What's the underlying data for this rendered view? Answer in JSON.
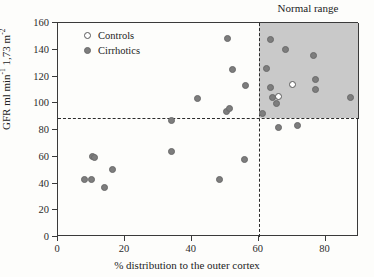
{
  "chart_data": {
    "type": "scatter",
    "title": "",
    "xlabel": "% distribution to the outer cortex",
    "ylabel": "GFR ml min⁻¹ 1,73 m⁻²",
    "ylabel_parts": {
      "main1": "GFR ml min",
      "sup1": "-1",
      "main2": " 1,73 m",
      "sup2": "-2"
    },
    "xlim": [
      0,
      90
    ],
    "ylim": [
      0,
      160
    ],
    "xticks": [
      0,
      20,
      40,
      60,
      80
    ],
    "yticks": [
      0,
      20,
      40,
      60,
      80,
      100,
      120,
      140,
      160
    ],
    "xtick_labels": [
      "0",
      "20",
      "40",
      "60",
      "80"
    ],
    "ytick_labels": [
      "0",
      "20",
      "40",
      "60",
      "80",
      "100",
      "120",
      "140",
      "160"
    ],
    "grid": false,
    "legend_position": "upper-left-inside",
    "annotations": [
      {
        "name": "normal-range-label",
        "text": "Normal range",
        "x": 75,
        "y": 166
      }
    ],
    "reference_lines": [
      {
        "name": "vertical-threshold",
        "orientation": "vertical",
        "value": 60,
        "style": "dashed"
      },
      {
        "name": "horizontal-threshold",
        "orientation": "horizontal",
        "value": 89,
        "style": "dashed"
      }
    ],
    "shaded_regions": [
      {
        "name": "normal-range-box",
        "x_range": [
          60,
          90
        ],
        "y_range": [
          89,
          160
        ],
        "color": "#c9c9c9",
        "label": "Normal range"
      }
    ],
    "series": [
      {
        "name": "Controls",
        "marker": "open-circle",
        "color": "#ffffff",
        "edge_color": "#595959",
        "points": [
          {
            "x": 66.0,
            "y": 105.0
          },
          {
            "x": 70.0,
            "y": 114.0
          }
        ]
      },
      {
        "name": "Cirrhotics",
        "marker": "filled-circle",
        "color": "#7d7d7d",
        "points": [
          {
            "x": 7.8,
            "y": 43.0
          },
          {
            "x": 10.0,
            "y": 43.0
          },
          {
            "x": 10.2,
            "y": 60.5
          },
          {
            "x": 11.0,
            "y": 59.5
          },
          {
            "x": 13.8,
            "y": 37.0
          },
          {
            "x": 16.2,
            "y": 50.5
          },
          {
            "x": 33.8,
            "y": 64.0
          },
          {
            "x": 33.9,
            "y": 87.0
          },
          {
            "x": 41.7,
            "y": 103.5
          },
          {
            "x": 48.2,
            "y": 43.0
          },
          {
            "x": 50.4,
            "y": 94.0
          },
          {
            "x": 51.2,
            "y": 96.0
          },
          {
            "x": 50.8,
            "y": 148.5
          },
          {
            "x": 52.2,
            "y": 125.0
          },
          {
            "x": 55.9,
            "y": 58.0
          },
          {
            "x": 56.2,
            "y": 113.5
          },
          {
            "x": 61.0,
            "y": 92.0
          },
          {
            "x": 62.2,
            "y": 126.0
          },
          {
            "x": 63.5,
            "y": 148.0
          },
          {
            "x": 63.6,
            "y": 112.0
          },
          {
            "x": 64.0,
            "y": 104.0
          },
          {
            "x": 65.3,
            "y": 99.5
          },
          {
            "x": 65.8,
            "y": 82.0
          },
          {
            "x": 68.0,
            "y": 140.0
          },
          {
            "x": 71.7,
            "y": 83.0
          },
          {
            "x": 76.5,
            "y": 135.5
          },
          {
            "x": 77.0,
            "y": 118.0
          },
          {
            "x": 77.0,
            "y": 110.5
          },
          {
            "x": 87.5,
            "y": 104.0
          }
        ]
      }
    ]
  },
  "legend": {
    "items": [
      {
        "label": "Controls",
        "marker": "open-circle"
      },
      {
        "label": "Cirrhotics",
        "marker": "filled-circle"
      }
    ]
  },
  "colors": {
    "shaded_region": "#c9c9c9",
    "point_fill": "#7d7d7d",
    "axis": "#3a3a3a",
    "text": "#232323",
    "background": "#fdfdfb"
  }
}
